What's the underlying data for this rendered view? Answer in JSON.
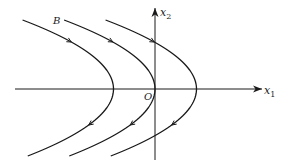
{
  "diagram": {
    "type": "phase-plane",
    "axes": {
      "horizontal_label": "x",
      "horizontal_subscript": "1",
      "vertical_label": "x",
      "vertical_subscript": "2",
      "origin_label": "O"
    },
    "trajectories": [
      {
        "name": "left",
        "vertex_offset": -1,
        "direction": "top-to-bottom"
      },
      {
        "name": "middle",
        "vertex_offset": 0,
        "direction": "top-to-bottom",
        "label": "B"
      },
      {
        "name": "right",
        "vertex_offset": 1,
        "direction": "top-to-bottom"
      }
    ],
    "colors": {
      "ink": "#1a1a1a",
      "background": "#ffffff"
    }
  }
}
